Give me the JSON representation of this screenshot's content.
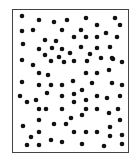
{
  "diagram": {
    "type": "dot-field",
    "frame": {
      "x": 12,
      "y": 9,
      "width": 118,
      "height": 145,
      "border_color": "#444444"
    },
    "dot_color": "#111111",
    "dot_radius": 2.3,
    "dots": [
      [
        22,
        16
      ],
      [
        39,
        20
      ],
      [
        54,
        22
      ],
      [
        67,
        20
      ],
      [
        86,
        18
      ],
      [
        115,
        18
      ],
      [
        97,
        25
      ],
      [
        120,
        25
      ],
      [
        22,
        31
      ],
      [
        33,
        30
      ],
      [
        62,
        30
      ],
      [
        81,
        30
      ],
      [
        106,
        33
      ],
      [
        74,
        37
      ],
      [
        86,
        37
      ],
      [
        97,
        37
      ],
      [
        117,
        37
      ],
      [
        45,
        40
      ],
      [
        56,
        41
      ],
      [
        23,
        44
      ],
      [
        81,
        47
      ],
      [
        97,
        48
      ],
      [
        110,
        47
      ],
      [
        39,
        49
      ],
      [
        52,
        48
      ],
      [
        62,
        49
      ],
      [
        70,
        53
      ],
      [
        90,
        54
      ],
      [
        45,
        55
      ],
      [
        59,
        57
      ],
      [
        101,
        58
      ],
      [
        112,
        58
      ],
      [
        22,
        60
      ],
      [
        33,
        65
      ],
      [
        51,
        61
      ],
      [
        64,
        62
      ],
      [
        74,
        61
      ],
      [
        87,
        61
      ],
      [
        113,
        59
      ],
      [
        122,
        62
      ],
      [
        39,
        73
      ],
      [
        48,
        75
      ],
      [
        86,
        73
      ],
      [
        97,
        73
      ],
      [
        109,
        70
      ],
      [
        22,
        82
      ],
      [
        39,
        85
      ],
      [
        51,
        85
      ],
      [
        62,
        85
      ],
      [
        73,
        81
      ],
      [
        92,
        83
      ],
      [
        112,
        83
      ],
      [
        122,
        85
      ],
      [
        47,
        93
      ],
      [
        74,
        94
      ],
      [
        82,
        90
      ],
      [
        20,
        96
      ],
      [
        27,
        102
      ],
      [
        36,
        100
      ],
      [
        62,
        96
      ],
      [
        74,
        102
      ],
      [
        86,
        100
      ],
      [
        97,
        96
      ],
      [
        107,
        98
      ],
      [
        120,
        96
      ],
      [
        39,
        109
      ],
      [
        46,
        109
      ],
      [
        62,
        109
      ],
      [
        86,
        109
      ],
      [
        97,
        109
      ],
      [
        109,
        113
      ],
      [
        118,
        109
      ],
      [
        82,
        115
      ],
      [
        71,
        118
      ],
      [
        39,
        120
      ],
      [
        120,
        120
      ],
      [
        23,
        126
      ],
      [
        54,
        124
      ],
      [
        66,
        124
      ],
      [
        110,
        127
      ],
      [
        31,
        137
      ],
      [
        39,
        132
      ],
      [
        74,
        132
      ],
      [
        86,
        132
      ],
      [
        97,
        132
      ],
      [
        110,
        136
      ],
      [
        122,
        135
      ],
      [
        51,
        140
      ],
      [
        62,
        142
      ],
      [
        27,
        145
      ],
      [
        39,
        145
      ],
      [
        82,
        144
      ],
      [
        104,
        146
      ],
      [
        122,
        144
      ]
    ]
  }
}
